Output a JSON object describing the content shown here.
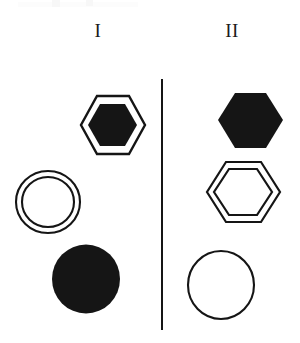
{
  "figure": {
    "type": "geometric-shape-comparison",
    "background_color": "#ffffff",
    "ink_color": "#151515",
    "width": 300,
    "height": 343,
    "columns": [
      {
        "id": "column-1",
        "label": "I",
        "label_position": {
          "x": 98,
          "y": 30
        },
        "shapes": [
          {
            "id": "shape-1-1",
            "name": "outlined-hexagon-with-filled-hexagon",
            "kind": "hexagon",
            "fill": "black",
            "outline": "single-thin-outline-with-gap",
            "orientation": "flat-left-right-points",
            "bbox": {
              "x": 81,
              "y": 96,
              "w": 64,
              "h": 59
            },
            "center": {
              "x": 113,
              "y": 125
            }
          },
          {
            "id": "shape-1-2",
            "name": "concentric-double-circle",
            "kind": "circle",
            "fill": "none",
            "outline": "double-concentric-outline",
            "bbox": {
              "x": 15,
              "y": 170,
              "w": 63,
              "h": 62
            },
            "center": {
              "x": 46,
              "y": 201
            }
          },
          {
            "id": "shape-1-3",
            "name": "solid-filled-circle",
            "kind": "circle",
            "fill": "black",
            "outline": "none",
            "bbox": {
              "x": 52,
              "y": 245,
              "w": 66,
              "h": 67
            },
            "center": {
              "x": 85,
              "y": 278
            }
          }
        ]
      },
      {
        "id": "column-2",
        "label": "II",
        "label_position": {
          "x": 232,
          "y": 30
        },
        "shapes": [
          {
            "id": "shape-2-1",
            "name": "solid-filled-hexagon",
            "kind": "hexagon",
            "fill": "black",
            "outline": "none",
            "orientation": "flat-left-right-points",
            "bbox": {
              "x": 218,
              "y": 93,
              "w": 65,
              "h": 55
            },
            "center": {
              "x": 250,
              "y": 120
            }
          },
          {
            "id": "shape-2-2",
            "name": "concentric-double-hexagon",
            "kind": "hexagon",
            "fill": "none",
            "outline": "double-concentric-outline",
            "orientation": "flat-left-right-points",
            "bbox": {
              "x": 207,
              "y": 162,
              "w": 73,
              "h": 60
            },
            "center": {
              "x": 243,
              "y": 192
            }
          },
          {
            "id": "shape-2-3",
            "name": "open-circle-outline",
            "kind": "circle",
            "fill": "none",
            "outline": "single-thin-outline",
            "bbox": {
              "x": 187,
              "y": 250,
              "w": 66,
              "h": 68
            },
            "center": {
              "x": 220,
              "y": 284
            }
          }
        ]
      }
    ],
    "divider": {
      "name": "vertical-divider-line",
      "x": 162,
      "y_top": 79,
      "y_bottom": 330,
      "thickness": 2,
      "color": "#151515"
    }
  }
}
